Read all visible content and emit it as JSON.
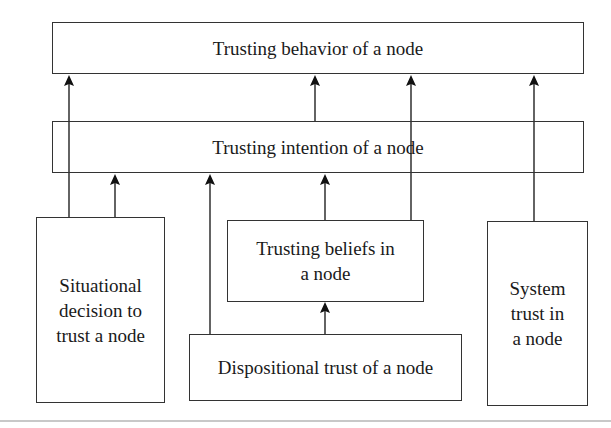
{
  "diagram": {
    "type": "trust-model-flow",
    "nodes": [
      {
        "id": "behavior",
        "label": "Trusting behavior of a node",
        "x": 52,
        "y": 22,
        "w": 532,
        "h": 52
      },
      {
        "id": "intention",
        "label": "Trusting intention of a node",
        "x": 52,
        "y": 121,
        "w": 532,
        "h": 52
      },
      {
        "id": "situational",
        "label": "Situational\ndecision to\ntrust a node",
        "x": 36,
        "y": 217,
        "w": 129,
        "h": 186
      },
      {
        "id": "beliefs",
        "label": "Trusting beliefs in\na node",
        "x": 227,
        "y": 220,
        "w": 197,
        "h": 82
      },
      {
        "id": "dispositional",
        "label": "Dispositional trust of a node",
        "x": 189,
        "y": 334,
        "w": 273,
        "h": 67
      },
      {
        "id": "system",
        "label": "System\ntrust in\na node",
        "x": 487,
        "y": 221,
        "w": 101,
        "h": 185
      }
    ],
    "edges": [
      {
        "from": "situational",
        "to": "behavior"
      },
      {
        "from": "situational",
        "to": "intention"
      },
      {
        "from": "dispositional",
        "to": "intention"
      },
      {
        "from": "beliefs",
        "to": "intention"
      },
      {
        "from": "intention",
        "to": "behavior"
      },
      {
        "from": "beliefs",
        "to": "behavior"
      },
      {
        "from": "system",
        "to": "behavior"
      },
      {
        "from": "dispositional",
        "to": "beliefs"
      }
    ]
  },
  "labels": {
    "behavior": "Trusting behavior of a node",
    "intention": "Trusting intention of a node",
    "situational": "Situational\ndecision to\ntrust a node",
    "beliefs": "Trusting beliefs in\na node",
    "dispositional": "Dispositional trust of a node",
    "system": "System\ntrust in\na node"
  }
}
